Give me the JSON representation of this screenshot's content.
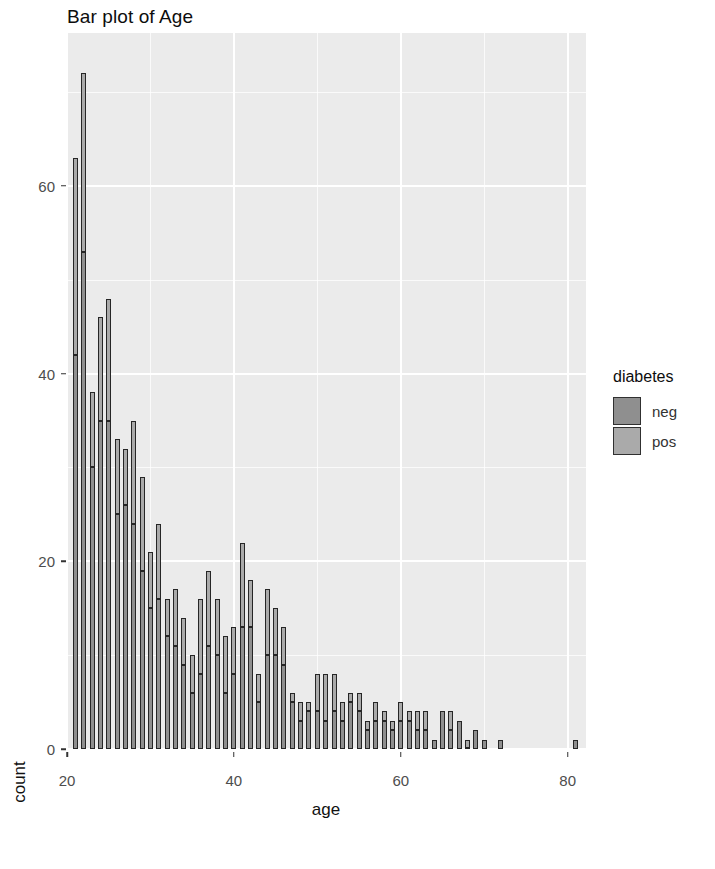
{
  "title": "Bar plot of Age",
  "axes": {
    "xlabel": "age",
    "ylabel": "count",
    "x_ticks": [
      "20",
      "40",
      "60",
      "80"
    ],
    "y_ticks": [
      "0",
      "20",
      "40",
      "60"
    ]
  },
  "legend": {
    "title": "diabetes",
    "items": [
      {
        "label": "neg",
        "color": "#8f8f8f"
      },
      {
        "label": "pos",
        "color": "#aaaaaa"
      }
    ]
  },
  "chart_data": {
    "type": "bar",
    "title": "Bar plot of Age",
    "xlabel": "age",
    "ylabel": "count",
    "xlim": [
      20,
      82
    ],
    "ylim": [
      0,
      73
    ],
    "grid": true,
    "legend_position": "right",
    "legend_title": "diabetes",
    "series": [
      {
        "name": "neg",
        "color": "#8f8f8f"
      },
      {
        "name": "pos",
        "color": "#aaaaaa"
      }
    ],
    "categories": [
      21,
      22,
      23,
      24,
      25,
      26,
      27,
      28,
      29,
      30,
      31,
      32,
      33,
      34,
      35,
      36,
      37,
      38,
      39,
      40,
      41,
      42,
      43,
      44,
      45,
      46,
      47,
      48,
      49,
      50,
      51,
      52,
      53,
      54,
      55,
      56,
      57,
      58,
      59,
      60,
      61,
      62,
      63,
      64,
      65,
      66,
      67,
      68,
      69,
      70,
      72,
      81
    ],
    "values": [
      63,
      72,
      38,
      46,
      48,
      33,
      32,
      35,
      29,
      21,
      24,
      16,
      17,
      14,
      10,
      16,
      19,
      16,
      12,
      13,
      22,
      18,
      8,
      17,
      15,
      13,
      6,
      5,
      5,
      8,
      8,
      8,
      5,
      6,
      6,
      3,
      5,
      4,
      3,
      5,
      4,
      4,
      4,
      1,
      4,
      4,
      3,
      1,
      2,
      1,
      1,
      1
    ],
    "counts_by_group": {
      "neg": [
        42,
        53,
        30,
        35,
        35,
        25,
        26,
        24,
        19,
        15,
        16,
        12,
        11,
        9,
        6,
        8,
        11,
        10,
        6,
        8,
        13,
        13,
        5,
        10,
        10,
        9,
        5,
        3,
        4,
        4,
        3,
        4,
        3,
        5,
        4,
        2,
        3,
        3,
        2,
        3,
        3,
        2,
        2,
        1,
        4,
        2,
        3,
        0,
        2,
        1,
        1,
        1
      ],
      "pos": [
        21,
        19,
        8,
        11,
        13,
        8,
        6,
        11,
        10,
        6,
        8,
        4,
        6,
        5,
        4,
        8,
        8,
        6,
        6,
        5,
        9,
        5,
        3,
        7,
        5,
        4,
        1,
        2,
        1,
        4,
        5,
        4,
        2,
        1,
        2,
        1,
        2,
        1,
        1,
        2,
        1,
        2,
        2,
        0,
        0,
        2,
        0,
        1,
        0,
        0,
        0,
        0
      ]
    }
  }
}
